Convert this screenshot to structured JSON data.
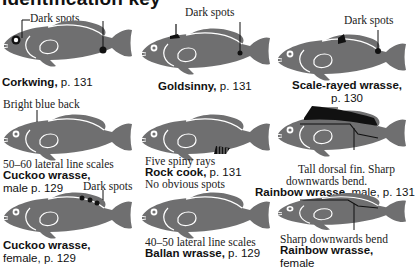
{
  "title": "Identification key",
  "colors": {
    "fish_body": "#6f6f70",
    "fish_outline": "#ffffff",
    "marker": "#111111",
    "text": "#111111"
  },
  "entries": [
    {
      "id": "corkwing",
      "name": "Corkwing,",
      "page": " p. 131",
      "annotation": "Dark spots"
    },
    {
      "id": "goldsinny",
      "name": "Goldsinny,",
      "page": " p. 131",
      "annotation": "Dark spots"
    },
    {
      "id": "scale-rayed-wrasse",
      "name": "Scale-rayed wrasse,",
      "page": "p. 130",
      "annotation": "Dark spots"
    },
    {
      "id": "cuckoo-wrasse-male",
      "name": "Cuckoo wrasse,",
      "page": "male p. 129",
      "annotation_top": "Bright blue back",
      "annotation_bottom": "50–60 lateral line scales"
    },
    {
      "id": "rock-cook",
      "name": "Rock cook,",
      "page": " p. 131",
      "annotation": "Five spiny rays"
    },
    {
      "id": "rainbow-wrasse-male",
      "name": "Rainbow wrasse,",
      "page": " male, p. 131",
      "annotation_line1": "Tall dorsal fin. Sharp",
      "annotation_line2": "downwards bend."
    },
    {
      "id": "cuckoo-wrasse-female",
      "name": "Cuckoo wrasse,",
      "page": "female, p. 129",
      "annotation": "Dark spots"
    },
    {
      "id": "ballan-wrasse",
      "name": "Ballan wrasse,",
      "page": " p. 129",
      "annotation_top": "No obvious spots",
      "annotation_bottom": "40–50 lateral line scales"
    },
    {
      "id": "rainbow-wrasse-female",
      "name": "Rainbow wrasse,",
      "page": "female",
      "annotation": "Sharp downwards bend"
    }
  ]
}
